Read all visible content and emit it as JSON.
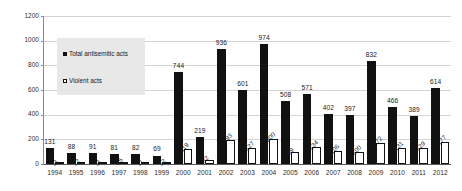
{
  "chart_data": {
    "type": "bar",
    "title": "",
    "xlabel": "",
    "ylabel": "",
    "ylim": [
      0,
      1200
    ],
    "yticks": [
      0,
      200,
      400,
      600,
      800,
      1000,
      1200
    ],
    "grid": true,
    "legend_position": "upper-left-inside",
    "categories": [
      "1994",
      "1995",
      "1996",
      "1997",
      "1998",
      "1999",
      "2000",
      "2001",
      "2002",
      "2003",
      "2004",
      "2005",
      "2006",
      "2007",
      "2008",
      "2009",
      "2010",
      "2011",
      "2012"
    ],
    "series": [
      {
        "name": "Total antisemitic acts",
        "color": "#111111",
        "style": "filled",
        "values": [
          131,
          88,
          91,
          81,
          82,
          69,
          744,
          219,
          936,
          601,
          974,
          508,
          571,
          402,
          397,
          832,
          466,
          389,
          614
        ]
      },
      {
        "name": "Violent acts",
        "color": "#ffffff",
        "style": "hollow",
        "values": [
          11,
          12,
          11,
          15,
          11,
          12,
          119,
          32,
          193,
          127,
          200,
          99,
          134,
          106,
          100,
          172,
          131,
          129,
          177
        ]
      }
    ]
  },
  "legend": {
    "items": [
      {
        "label": "Total antisemitic acts",
        "swatch": "filled-square-icon"
      },
      {
        "label": "Violent acts",
        "swatch": "hollow-square-icon"
      }
    ]
  }
}
